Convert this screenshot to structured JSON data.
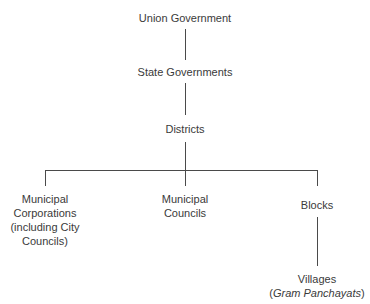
{
  "diagram": {
    "type": "hierarchy",
    "nodes": {
      "union": {
        "label": "Union Government"
      },
      "states": {
        "label": "State Governments"
      },
      "districts": {
        "label": "Districts"
      },
      "corporations": {
        "lines": [
          "Municipal",
          "Corporations",
          "(including City",
          "Councils)"
        ]
      },
      "councils": {
        "lines": [
          "Municipal",
          "Councils"
        ]
      },
      "blocks": {
        "label": "Blocks"
      },
      "villages": {
        "line1": "Villages",
        "line2_open": "(",
        "line2_italic": "Gram Panchayats",
        "line2_close": ")"
      }
    },
    "edges": [
      [
        "Union Government",
        "State Governments"
      ],
      [
        "State Governments",
        "Districts"
      ],
      [
        "Districts",
        "Municipal Corporations (including City Councils)"
      ],
      [
        "Districts",
        "Municipal Councils"
      ],
      [
        "Districts",
        "Blocks"
      ],
      [
        "Blocks",
        "Villages (Gram Panchayats)"
      ]
    ]
  }
}
